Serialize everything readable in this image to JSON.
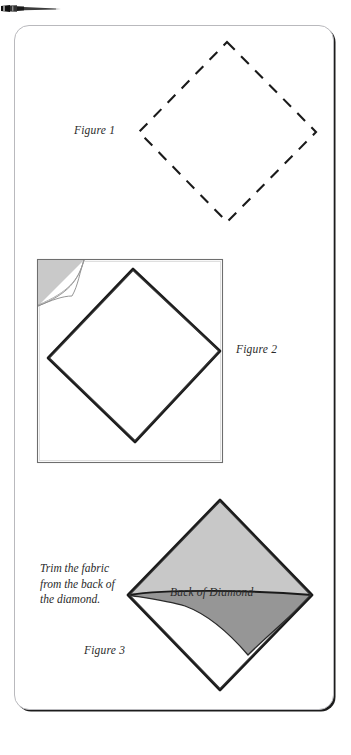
{
  "page": {
    "background_color": "#ffffff",
    "card": {
      "border_color": "#b9b9bd",
      "shadow_color": "#1c1c1c",
      "corner_radius": 15
    }
  },
  "decorations": {
    "needle_icon": "needle-icon"
  },
  "figures": [
    {
      "id": "figure-1",
      "label": "Figure 1",
      "shape": "dashed-diamond",
      "description": "Dashed outline diamond (square on point)",
      "stroke_color": "#1a1a1a",
      "fill": "none"
    },
    {
      "id": "figure-2",
      "label": "Figure 2",
      "shape": "square-with-diamond",
      "description": "Square of fabric with a drawn diamond inside and a peeled-back corner at the top left",
      "stroke_color": "#1a1a1a",
      "fold_fill": "#c9c9c9",
      "square_outline": "#6b6b6b"
    },
    {
      "id": "figure-3",
      "label": "Figure 3",
      "shape": "diamond-with-shaded-flap",
      "description": "Diamond with a light gray upper triangle and a darker gray trimmed flap",
      "stroke_color": "#1a1a1a",
      "light_fill": "#c8c8c8",
      "dark_fill": "#969696"
    }
  ],
  "annotations": {
    "trim_instruction": "Trim the fabric\nfrom the back of\nthe diamond.",
    "back_of_diamond": "Back of Diamond"
  }
}
